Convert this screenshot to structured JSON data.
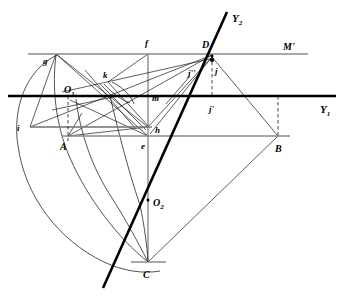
{
  "figure": {
    "type": "engineering-construction-drawing",
    "width": 343,
    "height": 300,
    "background_color": "#ffffff",
    "ink_color": "#000000",
    "guide_color": "#8a8a8a"
  },
  "labels": {
    "axis_y2": "Y",
    "axis_y2_sub": "2",
    "axis_y1": "Y",
    "axis_y1_sub": "1",
    "line_m_prime": "M'",
    "point_g": "g",
    "point_f": "f",
    "point_D": "D",
    "point_k": "k",
    "point_O1": "O",
    "point_O1_sub": "1",
    "point_i": "i",
    "point_m": "m",
    "point_h": "h",
    "point_A": "A",
    "point_e": "e",
    "point_B": "B",
    "point_O2": "O",
    "point_O2_sub": "2",
    "point_C": "C",
    "point_j": "j",
    "point_j_prime": "j'",
    "point_j_doubleprime": "j''"
  },
  "geometry": {
    "points": {
      "g": {
        "x": 56,
        "y": 54
      },
      "f": {
        "x": 148,
        "y": 54
      },
      "D": {
        "x": 212,
        "y": 55
      },
      "k": {
        "x": 112,
        "y": 80
      },
      "O1": {
        "x": 68,
        "y": 96
      },
      "i": {
        "x": 30,
        "y": 127
      },
      "m": {
        "x": 148,
        "y": 96
      },
      "h": {
        "x": 148,
        "y": 127
      },
      "A": {
        "x": 68,
        "y": 136
      },
      "e": {
        "x": 148,
        "y": 136
      },
      "B": {
        "x": 278,
        "y": 136
      },
      "O2": {
        "x": 148,
        "y": 200
      },
      "C": {
        "x": 148,
        "y": 262
      },
      "j": {
        "x": 212,
        "y": 66
      },
      "jp": {
        "x": 212,
        "y": 96
      },
      "jpp": {
        "x": 196,
        "y": 70
      }
    },
    "lines": {
      "m_prime": {
        "x1": 28,
        "y1": 54,
        "x2": 308,
        "y2": 54,
        "style": "gray"
      },
      "y1": {
        "x1": 8,
        "y1": 96,
        "x2": 336,
        "y2": 96,
        "style": "bold"
      },
      "y2": {
        "x1": 227,
        "y1": 12,
        "x2": 103,
        "y2": 288,
        "style": "bold"
      },
      "ab_base": {
        "x1": 62,
        "y1": 136,
        "x2": 290,
        "y2": 136,
        "style": "gray"
      },
      "ih": {
        "x1": 30,
        "y1": 127,
        "x2": 152,
        "y2": 127,
        "style": "gray"
      }
    },
    "arcs": [
      {
        "name": "big-left-arc",
        "cx": 148,
        "cy": 127,
        "r": 137,
        "from_deg": 168,
        "to_deg": 257
      },
      {
        "name": "arc-g-to-c",
        "cx": 68,
        "cy": 136,
        "r": 126,
        "from_deg": 288,
        "to_deg": 2
      },
      {
        "name": "arc-a-to-c",
        "cx": 148,
        "cy": 54,
        "r": 208,
        "from_deg": 80,
        "to_deg": 104
      },
      {
        "name": "small-arc-k1",
        "cx": 112,
        "cy": 80,
        "r": 32,
        "from_deg": 8,
        "to_deg": 68
      },
      {
        "name": "small-arc-k2",
        "cx": 100,
        "cy": 74,
        "r": 36,
        "from_deg": 10,
        "to_deg": 62
      }
    ],
    "dashes": [
      {
        "name": "dash-O1-A",
        "x1": 68,
        "y1": 96,
        "x2": 68,
        "y2": 140
      },
      {
        "name": "dash-j-jp",
        "x1": 212,
        "y1": 60,
        "x2": 212,
        "y2": 96
      },
      {
        "name": "dash-B",
        "x1": 278,
        "y1": 96,
        "x2": 278,
        "y2": 136
      }
    ]
  }
}
